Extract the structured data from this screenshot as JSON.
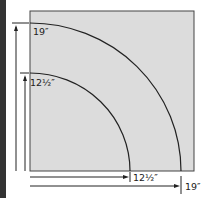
{
  "diagram": {
    "square_fill": "#dcdcdc",
    "labels": {
      "outer_vertical": "19″",
      "inner_vertical": "12½″",
      "inner_horizontal": "12½″",
      "outer_horizontal": "19″"
    }
  }
}
